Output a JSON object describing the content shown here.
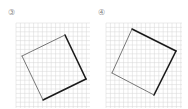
{
  "figures": [
    {
      "label": "③",
      "grid": {
        "x": 16,
        "y": 23,
        "width": 74,
        "height": 85,
        "cell": 4.4,
        "color": "#d6d6d6"
      },
      "square": {
        "points": [
          [
            65,
            35
          ],
          [
            86,
            79
          ],
          [
            43,
            100
          ],
          [
            22,
            56
          ]
        ],
        "thin_color": "#555555",
        "thick_color": "#1a1a1a",
        "thick_edges": [
          [
            0,
            1
          ],
          [
            1,
            2
          ]
        ]
      }
    },
    {
      "label": "④",
      "grid": {
        "x": 106,
        "y": 23,
        "width": 76,
        "height": 85,
        "cell": 4.4,
        "color": "#d6d6d6"
      },
      "square": {
        "points": [
          [
            132,
            29
          ],
          [
            176,
            51
          ],
          [
            154,
            95
          ],
          [
            112,
            73
          ]
        ],
        "thin_color": "#555555",
        "thick_color": "#1a1a1a",
        "thick_edges": [
          [
            0,
            1
          ],
          [
            1,
            2
          ]
        ]
      }
    }
  ]
}
